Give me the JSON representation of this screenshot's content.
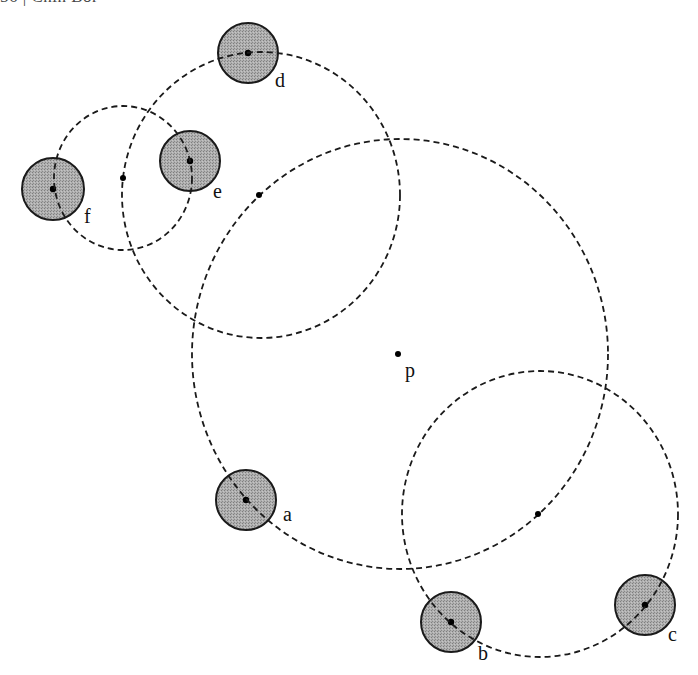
{
  "header": {
    "text": "56 | Chin Bor"
  },
  "colors": {
    "dashed_stroke": "#1a1a1a",
    "disk_fill": "#a9a9a9",
    "disk_stroke": "#1a1a1a",
    "dot": "#000000",
    "background": "#ffffff"
  },
  "dashed_circles": [
    {
      "id": "circle-p",
      "cx": 400,
      "cy": 354,
      "rx": 208,
      "ry": 215
    },
    {
      "id": "circle-d",
      "cx": 261,
      "cy": 195,
      "rx": 139,
      "ry": 143
    },
    {
      "id": "circle-f",
      "cx": 123,
      "cy": 178,
      "rx": 69,
      "ry": 72
    },
    {
      "id": "circle-bc",
      "cx": 540,
      "cy": 514,
      "rx": 138,
      "ry": 143
    }
  ],
  "center_dots": [
    {
      "id": "p",
      "x": 398,
      "y": 354
    },
    {
      "id": "center-d-circle",
      "x": 259,
      "y": 195
    },
    {
      "id": "center-f-circle",
      "x": 123,
      "y": 178
    },
    {
      "id": "center-bc-circle",
      "x": 538,
      "y": 514
    }
  ],
  "disks": [
    {
      "id": "a",
      "cx": 246,
      "cy": 500,
      "r": 30
    },
    {
      "id": "b",
      "cx": 451,
      "cy": 622,
      "r": 30
    },
    {
      "id": "c",
      "cx": 645,
      "cy": 605,
      "r": 30
    },
    {
      "id": "d",
      "cx": 248,
      "cy": 53,
      "r": 30
    },
    {
      "id": "e",
      "cx": 190,
      "cy": 161,
      "r": 30
    },
    {
      "id": "f",
      "cx": 53,
      "cy": 189,
      "r": 31
    }
  ],
  "labels": [
    {
      "text": "a",
      "x": 283,
      "y": 521
    },
    {
      "text": "b",
      "x": 478,
      "y": 660
    },
    {
      "text": "c",
      "x": 668,
      "y": 641
    },
    {
      "text": "d",
      "x": 275,
      "y": 87
    },
    {
      "text": "e",
      "x": 213,
      "y": 198
    },
    {
      "text": "f",
      "x": 84,
      "y": 223
    },
    {
      "text": "p",
      "x": 405,
      "y": 377
    }
  ]
}
